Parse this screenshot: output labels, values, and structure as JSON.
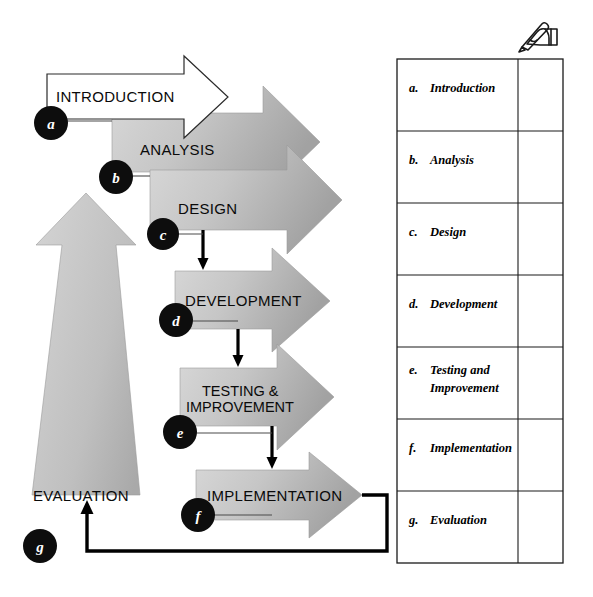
{
  "diagram": {
    "icon": "hand-writing-pencil-icon",
    "stages": [
      {
        "key": "a",
        "marker": "a",
        "label": "INTRODUCTION",
        "style": "outline"
      },
      {
        "key": "b",
        "marker": "b",
        "label": "ANALYSIS",
        "style": "gray"
      },
      {
        "key": "c",
        "marker": "c",
        "label": "DESIGN",
        "style": "gray"
      },
      {
        "key": "d",
        "marker": "d",
        "label": "DEVELOPMENT",
        "style": "gray"
      },
      {
        "key": "e",
        "marker": "e",
        "label_line1": "TESTING &",
        "label_line2": "IMPROVEMENT",
        "style": "gray"
      },
      {
        "key": "f",
        "marker": "f",
        "label": "IMPLEMENTATION",
        "style": "gray"
      },
      {
        "key": "g",
        "marker": "g",
        "label": "EVALUATION",
        "style": "gray-vertical"
      }
    ],
    "colors": {
      "arrow_fill_light": "#d4d4d4",
      "arrow_fill_dark": "#a6a6a6",
      "marker_fill": "#0d0d0d",
      "marker_text": "#ffffff",
      "outline_arrow_fill": "#ffffff",
      "line": "#000000"
    }
  },
  "table": {
    "rows": [
      {
        "letter": "a.",
        "label": "Introduction",
        "note": ""
      },
      {
        "letter": "b.",
        "label": "Analysis",
        "note": ""
      },
      {
        "letter": "c.",
        "label": "Design",
        "note": ""
      },
      {
        "letter": "d.",
        "label": "Development",
        "note": ""
      },
      {
        "letter": "e.",
        "label_line1": "Testing and",
        "label_line2": "Improvement",
        "note": ""
      },
      {
        "letter": "f.",
        "label": "Implementation",
        "note": ""
      },
      {
        "letter": "g.",
        "label": "Evaluation",
        "note": ""
      }
    ]
  }
}
